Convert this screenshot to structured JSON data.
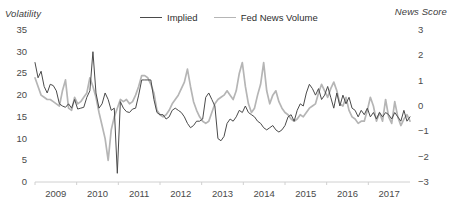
{
  "chart_data": {
    "type": "line",
    "title": "",
    "xlabel": "",
    "ylabel": "Volatility",
    "y2label": "News Score",
    "ylim": [
      0,
      35
    ],
    "y2lim": [
      -3,
      3
    ],
    "grid": false,
    "legend_position": "top-center",
    "x_tick_labels": [
      "2009",
      "2010",
      "2011",
      "2012",
      "2013",
      "2014",
      "2015",
      "2016",
      "2017"
    ],
    "y_left_ticks": [
      "35",
      "30",
      "25",
      "20",
      "15",
      "10",
      "5",
      "0"
    ],
    "y_right_ticks": [
      "3",
      "2",
      "1",
      "0",
      "-1",
      "-2",
      "-3"
    ],
    "colors": {
      "implied": "#4a4a4a",
      "fed_news_volume": "#b5b5b5",
      "axis": "#d0d0d0",
      "text": "#404040"
    },
    "series": [
      {
        "name": "Implied",
        "axis": "left",
        "color": "#4a4a4a",
        "values": [
          27.5,
          24.0,
          25.5,
          22.0,
          20.5,
          22.5,
          22.2,
          21.0,
          18.0,
          17.5,
          17.2,
          18.0,
          17.0,
          19.0,
          16.8,
          17.0,
          17.2,
          19.5,
          21.0,
          30.0,
          20.5,
          17.0,
          18.0,
          20.5,
          19.0,
          16.5,
          17.0,
          2.0,
          18.5,
          17.0,
          16.2,
          16.0,
          16.8,
          17.0,
          20.0,
          23.5,
          23.5,
          23.5,
          23.5,
          19.0,
          16.0,
          15.5,
          15.5,
          14.5,
          15.0,
          16.5,
          17.0,
          16.5,
          16.0,
          15.0,
          13.5,
          12.5,
          13.0,
          14.0,
          14.0,
          14.5,
          19.5,
          20.5,
          19.0,
          17.5,
          10.0,
          9.5,
          10.5,
          13.5,
          14.5,
          14.0,
          15.0,
          16.5,
          16.0,
          17.5,
          16.0,
          15.5,
          15.0,
          14.0,
          13.5,
          12.5,
          12.0,
          12.5,
          13.0,
          12.0,
          11.5,
          12.0,
          13.0,
          15.0,
          15.5,
          14.0,
          16.5,
          18.0,
          17.5,
          20.5,
          22.5,
          21.5,
          20.0,
          21.5,
          19.0,
          20.0,
          22.0,
          19.5,
          17.0,
          20.5,
          17.5,
          20.0,
          18.0,
          19.5,
          17.0,
          16.5,
          15.0,
          16.5,
          15.5,
          17.0,
          15.0,
          16.0,
          14.5,
          16.0,
          15.0,
          16.0,
          15.5,
          14.5,
          16.0,
          15.0,
          14.0,
          16.5,
          14.0,
          15.0
        ]
      },
      {
        "name": "Fed News Volume",
        "axis": "left",
        "color": "#b5b5b5",
        "values": [
          24.0,
          22.0,
          20.0,
          19.5,
          19.0,
          19.0,
          18.5,
          18.0,
          17.5,
          21.0,
          23.5,
          17.0,
          16.5,
          19.5,
          18.0,
          18.5,
          19.5,
          20.5,
          24.0,
          22.0,
          19.5,
          16.0,
          13.0,
          10.0,
          5.0,
          12.0,
          15.0,
          17.0,
          19.0,
          18.5,
          19.0,
          18.0,
          18.5,
          20.0,
          22.0,
          24.5,
          24.5,
          24.0,
          22.5,
          20.5,
          16.5,
          15.5,
          15.0,
          15.5,
          16.5,
          18.0,
          19.0,
          20.0,
          21.5,
          23.0,
          26.0,
          22.0,
          18.5,
          16.5,
          15.0,
          14.0,
          13.5,
          14.0,
          16.0,
          18.0,
          19.0,
          19.5,
          20.0,
          21.0,
          20.0,
          19.0,
          21.0,
          25.0,
          27.5,
          22.0,
          18.0,
          16.0,
          17.0,
          20.0,
          22.5,
          27.5,
          21.0,
          18.0,
          20.0,
          21.0,
          18.5,
          17.0,
          16.0,
          15.5,
          14.5,
          14.0,
          14.5,
          15.5,
          15.0,
          16.0,
          17.0,
          17.5,
          18.0,
          20.5,
          22.5,
          21.0,
          19.5,
          21.5,
          23.0,
          21.0,
          18.0,
          17.5,
          19.5,
          16.5,
          15.0,
          14.5,
          13.5,
          14.0,
          14.0,
          16.5,
          19.5,
          17.5,
          14.0,
          16.0,
          14.0,
          19.0,
          15.0,
          13.5,
          18.5,
          15.0,
          13.0,
          14.5,
          15.5,
          14.0
        ]
      }
    ]
  }
}
